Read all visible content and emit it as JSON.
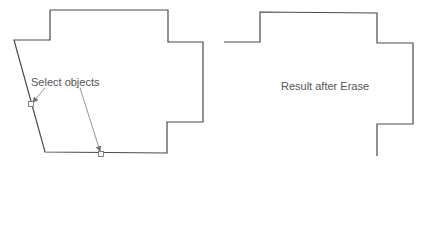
{
  "colors": {
    "outline": "#4a4a4a",
    "annotation": "#777777",
    "text": "#555555"
  },
  "left_panel": {
    "label": "Select objects",
    "outline_points": "50,10 168,10 168,42 203,42 203,122 167,122 167,153 45,152 14,40 50,40 50,10",
    "pick_boxes": [
      {
        "x": 31,
        "y": 104
      },
      {
        "x": 101,
        "y": 154
      }
    ],
    "leaders": [
      {
        "x1": 45,
        "y1": 88,
        "x2": 33,
        "y2": 102
      },
      {
        "x1": 80,
        "y1": 88,
        "x2": 100,
        "y2": 151
      }
    ]
  },
  "right_panel": {
    "label": "Result after Erase",
    "outline_points": "224,42 260,42 260,12 377,13 377,43 413,43 413,124 377,124 377,156"
  }
}
